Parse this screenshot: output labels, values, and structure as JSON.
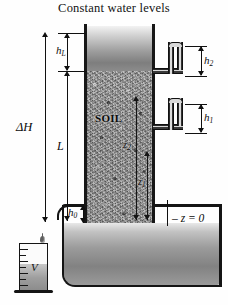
{
  "figure": {
    "title": "Constant water levels",
    "type": "constant-head-permeameter-diagram"
  },
  "labels": {
    "head_loss": "h",
    "head_loss_sub": "L",
    "total_head_diff": "ΔH",
    "sample_length": "L",
    "tailwater": "h",
    "tailwater_sub": "0",
    "piezo_upper": "h",
    "piezo_upper_sub": "2",
    "piezo_lower": "h",
    "piezo_lower_sub": "1",
    "elevation_upper": "z",
    "elevation_upper_sub": "2",
    "elevation_lower": "z",
    "elevation_lower_sub": "1",
    "datum": "– z = 0",
    "soil": "SOIL",
    "volume": "V"
  },
  "colors": {
    "ink": "#101010",
    "water_light": "#e8e8e8",
    "water_dark": "#828282",
    "soil_grey": "#909090",
    "background": "#ffffff"
  },
  "cylinder": {
    "graduation_count": 7,
    "collected_label": "V"
  },
  "droplets": {
    "count": 2
  }
}
